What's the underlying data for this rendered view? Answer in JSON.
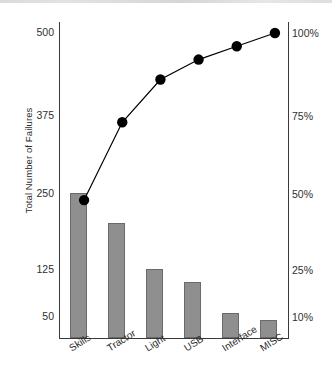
{
  "chart_data": {
    "type": "bar",
    "title": "",
    "subtitle": "",
    "xlabel": "",
    "ylabel": "Total Number of Failures",
    "y2label": "",
    "grid": false,
    "legend": "none",
    "categories": [
      "Skills",
      "Tractor",
      "Light",
      "USB",
      "Interface",
      "MISC"
    ],
    "series": [
      {
        "name": "Total Number of Failures",
        "type": "bar",
        "axis": "left",
        "values": [
          250,
          200,
          125,
          105,
          55,
          42
        ]
      },
      {
        "name": "Cumulative Percentage",
        "type": "line",
        "axis": "right",
        "values": [
          48,
          73,
          86,
          92,
          96,
          100
        ]
      }
    ],
    "yticks": [
      500,
      375,
      250,
      125,
      50
    ],
    "ytick_labels": [
      "500",
      "375",
      "250",
      "125",
      "50"
    ],
    "y2ticks": [
      100,
      75,
      50,
      25,
      10
    ],
    "y2tick_labels": [
      "100%",
      "75%",
      "50%",
      "25%",
      "10%"
    ],
    "ylim": [
      0,
      500
    ],
    "y2lim": [
      0,
      100
    ],
    "bar_color": "#8f8f8f",
    "bar_edge_color": "#6a6a6a",
    "line_color": "#000000",
    "marker_color": "#000000",
    "axis_color": "#3a3a3a",
    "background": "#ffffff"
  },
  "axis": {
    "y_title": "Total Number of Failures",
    "left_ticks": [
      {
        "label": "500",
        "value": 500
      },
      {
        "label": "375",
        "value": 375
      },
      {
        "label": "250",
        "value": 250
      },
      {
        "label": "125",
        "value": 125
      },
      {
        "label": "50",
        "value": 50
      }
    ],
    "right_ticks": [
      {
        "label": "100%",
        "value": 100
      },
      {
        "label": "75%",
        "value": 75
      },
      {
        "label": "50%",
        "value": 50
      },
      {
        "label": "25%",
        "value": 25
      },
      {
        "label": "10%",
        "value": 10
      }
    ],
    "categories": [
      {
        "label": "Skills"
      },
      {
        "label": "Tractor"
      },
      {
        "label": "Light"
      },
      {
        "label": "USB"
      },
      {
        "label": "Interface"
      },
      {
        "label": "MISC"
      }
    ]
  }
}
